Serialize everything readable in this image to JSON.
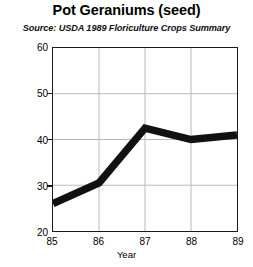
{
  "chart_data": {
    "type": "line",
    "title": "Pot Geraniums (seed)",
    "subtitle": "Source: USDA 1989 Floriculture Crops Summary",
    "xlabel": "Year",
    "ylabel": "Millions of pots",
    "categories": [
      "85",
      "86",
      "87",
      "88",
      "89"
    ],
    "values": [
      26,
      30.5,
      42.5,
      40,
      41
    ],
    "series": [
      {
        "name": "Pot Geraniums (seed)",
        "values": [
          26,
          30.5,
          42.5,
          40,
          41
        ]
      }
    ],
    "ylim": [
      20,
      60
    ],
    "yticks": [
      "20",
      "30",
      "40",
      "50",
      "60"
    ],
    "ytick_values": [
      20,
      30,
      40,
      50,
      60
    ],
    "xticks": [
      "85",
      "86",
      "87",
      "88",
      "89"
    ],
    "grid": true,
    "legend": false,
    "line_color": "#111111",
    "grid_color": "#b8b8b8",
    "axis_color": "#1a1a1a"
  }
}
